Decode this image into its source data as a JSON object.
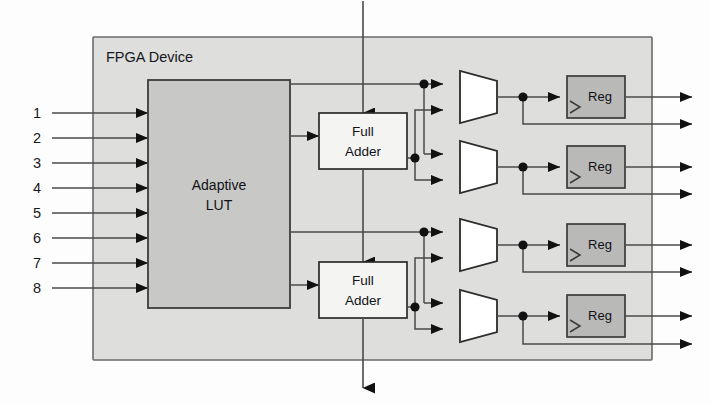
{
  "diagram": {
    "title": "FPGA Device",
    "container_label": "FPGA Device",
    "blocks": {
      "lut_line1": "Adaptive",
      "lut_line2": "LUT",
      "adder_line1": "Full",
      "adder_line2": "Adder",
      "register_label": "Reg"
    },
    "inputs": [
      {
        "label": "1"
      },
      {
        "label": "2"
      },
      {
        "label": "3"
      },
      {
        "label": "4"
      },
      {
        "label": "5"
      },
      {
        "label": "6"
      },
      {
        "label": "7"
      },
      {
        "label": "8"
      }
    ],
    "full_adders": [
      {
        "line1": "Full",
        "line2": "Adder"
      },
      {
        "line1": "Full",
        "line2": "Adder"
      }
    ],
    "registers": [
      {
        "label": "Reg"
      },
      {
        "label": "Reg"
      },
      {
        "label": "Reg"
      },
      {
        "label": "Reg"
      }
    ],
    "multiplexers": [
      {
        "name": "mux-1"
      },
      {
        "name": "mux-2"
      },
      {
        "name": "mux-3"
      },
      {
        "name": "mux-4"
      }
    ],
    "outputs": [
      {
        "name": "output-1-registered"
      },
      {
        "name": "output-2-combinational"
      },
      {
        "name": "output-3-registered"
      },
      {
        "name": "output-4-combinational"
      },
      {
        "name": "output-5-registered"
      },
      {
        "name": "output-6-combinational"
      },
      {
        "name": "output-7-registered"
      },
      {
        "name": "output-8-combinational"
      }
    ],
    "carry": {
      "carry_in": "carry-in",
      "carry_out": "carry-out"
    },
    "colors": {
      "page_background": "#fdfdfd",
      "fpga_fill": "#dededd",
      "fpga_stroke": "#6a6a6a",
      "lut_fill": "#c8c8c7",
      "lut_stroke": "#3b3b3b",
      "adder_fill": "#f4f4f3",
      "adder_stroke": "#2b2b2b",
      "mux_fill": "#ffffff",
      "mux_stroke": "#2b2b2b",
      "reg_fill": "#b9b9b8",
      "reg_stroke": "#3b3b3b",
      "wire": "#4a4a4a",
      "arrow": "#111111",
      "text": "#15161a"
    }
  }
}
